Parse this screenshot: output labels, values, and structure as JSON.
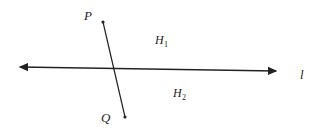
{
  "diagram": {
    "type": "geometry",
    "line": {
      "label": "l",
      "start": [
        18,
        67
      ],
      "end": [
        278,
        71
      ],
      "arrows": "both"
    },
    "segment": {
      "from": {
        "label": "P",
        "point": [
          103,
          22
        ]
      },
      "to": {
        "label": "Q",
        "point": [
          125,
          117
        ]
      }
    },
    "half_planes": [
      {
        "label": "H",
        "subscript": "1",
        "position": [
          155,
          44
        ]
      },
      {
        "label": "H",
        "subscript": "2",
        "position": [
          172,
          97
        ]
      }
    ],
    "colors": {
      "stroke": "#222222",
      "background": "#ffffff"
    }
  }
}
